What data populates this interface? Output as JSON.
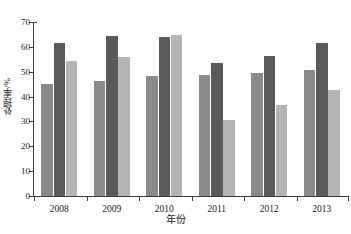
{
  "chart_data": {
    "type": "bar",
    "title": "",
    "xlabel": "年份",
    "ylabel": "处理率/%",
    "categories": [
      "2008",
      "2009",
      "2010",
      "2011",
      "2012",
      "2013"
    ],
    "series": [
      {
        "name": "series-1",
        "color": "#8a8a8a",
        "values": [
          45.0,
          46.3,
          48.2,
          48.5,
          49.6,
          50.7
        ]
      },
      {
        "name": "series-2",
        "color": "#5a5a5a",
        "values": [
          61.5,
          64.2,
          63.8,
          53.5,
          56.3,
          61.7
        ]
      },
      {
        "name": "series-3",
        "color": "#b4b4b4",
        "values": [
          54.3,
          56.0,
          64.8,
          30.6,
          36.8,
          42.6
        ]
      }
    ],
    "ylim": [
      0,
      70
    ],
    "yticks": [
      0,
      10,
      20,
      30,
      40,
      50,
      60,
      70
    ],
    "ytick_labels": [
      "0",
      "10",
      "20",
      "30",
      "40",
      "50",
      "60",
      "70"
    ],
    "grid": false,
    "legend_position": "top"
  },
  "legend": {
    "entries": [
      {
        "label": "",
        "color": "#b4b4b4"
      }
    ],
    "clipped_text": ""
  },
  "axes": {
    "y_title": "处理率/%",
    "x_title": "年份"
  }
}
